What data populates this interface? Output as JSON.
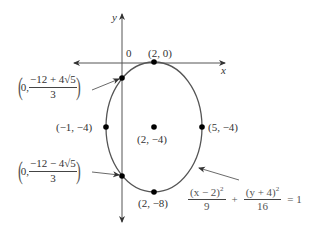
{
  "diagram": {
    "type": "ellipse-graph",
    "axes": {
      "x_label": "x",
      "y_label": "y",
      "origin_label": "0"
    },
    "equation": {
      "term1_numerator": "(x − 2)",
      "term1_exp": "2",
      "term1_denominator": "9",
      "plus": "+",
      "term2_numerator": "(y + 4)",
      "term2_exp": "2",
      "term2_denominator": "16",
      "equals": "= 1"
    },
    "points": {
      "top": "(2, 0)",
      "bottom": "(2, −8)",
      "left": "(−1, −4)",
      "right": "(5, −4)",
      "center": "(2, −4)"
    },
    "intercepts": {
      "upper": {
        "x": "0,",
        "numerator": "−12 + 4√5",
        "denominator": "3"
      },
      "lower": {
        "x": "0,",
        "numerator": "−12 − 4√5",
        "denominator": "3"
      }
    },
    "colors": {
      "curve": "#555555",
      "axes": "#444444",
      "points": "#000000"
    }
  }
}
